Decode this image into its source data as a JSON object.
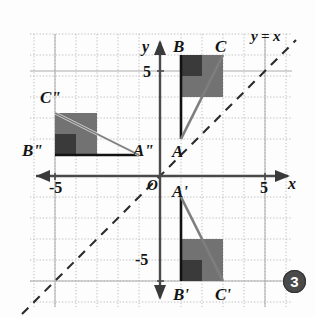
{
  "figure": {
    "badge": "3",
    "line_label": "y = x",
    "axis_x_label": "x",
    "axis_y_label": "y",
    "origin_label": "O",
    "tick_labels": {
      "x_positive": "5",
      "x_negative": "-5",
      "y_positive": "5",
      "y_negative": "-5"
    },
    "colors": {
      "grid": "#b9b9b9",
      "axis": "#3a3a3a",
      "dashed_line": "#2e2e2e",
      "shape_fill_light": "#6e6e6e",
      "shape_fill_dark": "#3c3c3c",
      "outline": "#1a1a1a",
      "hypotenuse": "#777777",
      "text": "#141414",
      "badge_bg": "#4a4a4a",
      "background": "#fdfdfd"
    },
    "vertex_labels": [
      {
        "name": "A",
        "x": 159,
        "y": 143
      },
      {
        "name": "B",
        "x": 173,
        "y": 46
      },
      {
        "name": "C",
        "x": 216,
        "y": 46
      },
      {
        "name": "A'",
        "x": 172,
        "y": 193
      },
      {
        "name": "B'",
        "x": 176,
        "y": 302
      },
      {
        "name": "C'",
        "x": 218,
        "y": 302
      },
      {
        "name": "A\"",
        "x": 114,
        "y": 143
      },
      {
        "name": "B\"",
        "x": 23,
        "y": 143
      },
      {
        "name": "C\"",
        "x": 40,
        "y": 98
      }
    ],
    "triangles": [
      {
        "id": "ABC",
        "vertices": "A(0,1) B(0,7) C(3,7)"
      },
      {
        "id": "A'B'C'",
        "vertices": "A'(0,-1) B'(0,-7) C'(3,-7)"
      },
      {
        "id": "A''B''C''",
        "vertices": "A''(-1,0) B''(-7,0) C''(-7,3)"
      }
    ]
  }
}
